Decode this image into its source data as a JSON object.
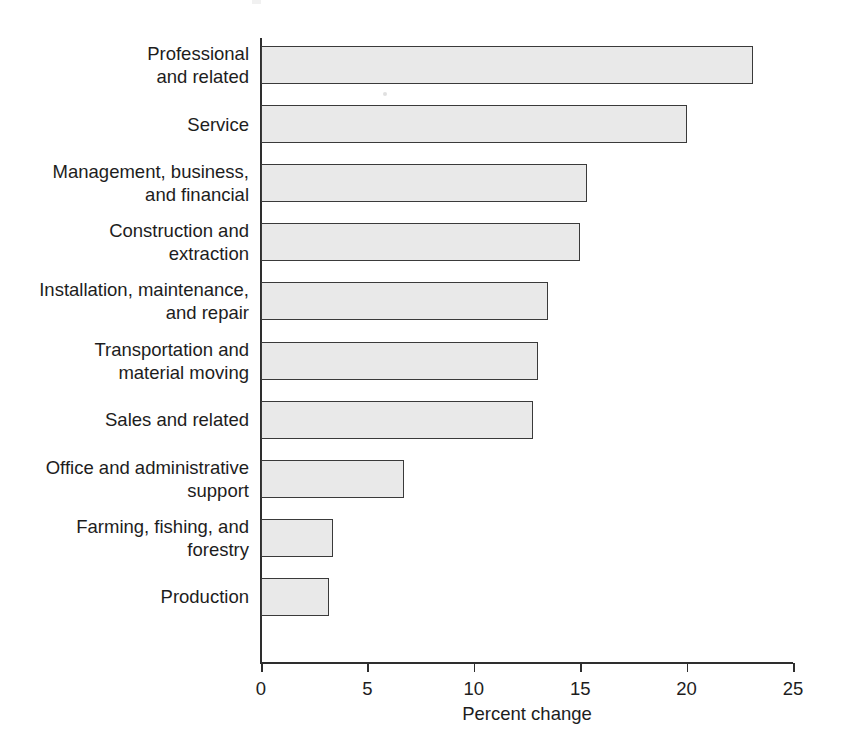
{
  "chart_data": {
    "type": "bar",
    "orientation": "horizontal",
    "title": "",
    "subtitle": "",
    "xlabel": "Percent change",
    "ylabel": "",
    "xlim": [
      0,
      25
    ],
    "xticks": [
      0,
      5,
      10,
      15,
      20,
      25
    ],
    "xtick_labels": [
      "0",
      "5",
      "10",
      "15",
      "20",
      "25"
    ],
    "grid": false,
    "legend": null,
    "categories": [
      "Professional\nand related",
      "Service",
      "Management, business,\nand financial",
      "Construction and\nextraction",
      "Installation, maintenance,\nand repair",
      "Transportation and\nmaterial moving",
      "Sales and related",
      "Office and administrative\nsupport",
      "Farming, fishing, and\nforestry",
      "Production"
    ],
    "values": [
      23.1,
      20.0,
      15.3,
      15.0,
      13.5,
      13.0,
      12.8,
      6.7,
      3.4,
      3.2
    ],
    "bar_fill_color": "#e9e9e9",
    "bar_border_color": "#3a3a3a",
    "axis_color": "#2e2e2e",
    "text_color": "#1d1d1d",
    "background_color": "#ffffff"
  },
  "axis": {
    "x_title": "Percent change"
  }
}
